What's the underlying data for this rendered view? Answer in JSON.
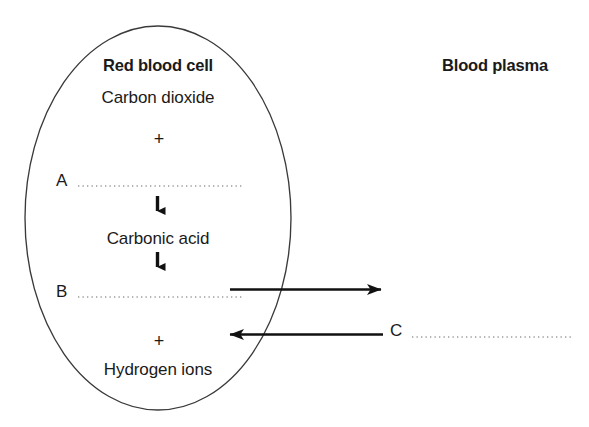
{
  "diagram": {
    "title_visible": false,
    "cell": {
      "name": "red-blood-cell",
      "label": "Red blood cell",
      "outline_color": "#3a3a3a",
      "fill_color": "#ffffff",
      "shape": "ellipse"
    },
    "plasma": {
      "name": "blood-plasma",
      "label": "Blood plasma"
    },
    "substances": [
      {
        "id": "carbon-dioxide",
        "label": "Carbon dioxide"
      },
      {
        "id": "carbonic-acid",
        "label": "Carbonic acid"
      },
      {
        "id": "hydrogen-ions",
        "label": "Hydrogen ions"
      }
    ],
    "operators": [
      {
        "id": "plus-top",
        "label": "+"
      },
      {
        "id": "plus-bottom",
        "label": "+"
      }
    ],
    "labels": [
      {
        "id": "label-a",
        "label": "A",
        "leader": "dotted"
      },
      {
        "id": "label-b",
        "label": "B",
        "leader": "dotted"
      },
      {
        "id": "label-c",
        "label": "C",
        "leader": "dotted"
      }
    ],
    "arrows": [
      {
        "id": "arrow-co2-to-carbonic-acid",
        "direction": "down"
      },
      {
        "id": "arrow-carbonic-acid-to-ions",
        "direction": "down"
      },
      {
        "id": "arrow-cell-to-plasma",
        "direction": "right"
      },
      {
        "id": "arrow-plasma-to-cell",
        "direction": "left"
      }
    ],
    "colors": {
      "ink": "#1a1a1a",
      "outline": "#3a3a3a",
      "dotted": "#9a9a9a",
      "background": "#ffffff"
    }
  }
}
